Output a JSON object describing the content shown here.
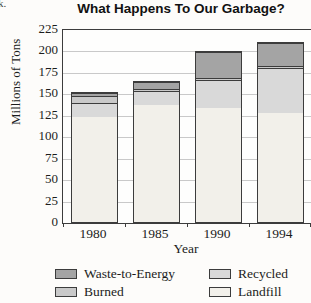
{
  "artifact": {
    "text": "k."
  },
  "chart": {
    "title": "What Happens To Our Garbage?",
    "xlabel": "Year",
    "ylabel": "Millions of Tons"
  },
  "chart_data": {
    "type": "bar",
    "subtype": "stacked",
    "title": "What Happens To Our Garbage?",
    "xlabel": "Year",
    "ylabel": "Millions of Tons",
    "categories": [
      "1980",
      "1985",
      "1990",
      "1994"
    ],
    "series": [
      {
        "name": "Landfill",
        "color": "#f2f0ea",
        "values": [
          125,
          139,
          134,
          129
        ]
      },
      {
        "name": "Recycled",
        "color": "#d9d9d9",
        "values": [
          16,
          16,
          33,
          53
        ]
      },
      {
        "name": "Burned",
        "color": "#c9c9c9",
        "values": [
          9,
          3,
          2,
          2
        ]
      },
      {
        "name": "Waste-to-Energy",
        "color": "#a4a4a4",
        "values": [
          3,
          8,
          31,
          27
        ]
      }
    ],
    "totals": [
      153,
      166,
      200,
      211
    ],
    "ylim": [
      0,
      225
    ],
    "yticks": [
      0,
      25,
      50,
      75,
      100,
      125,
      150,
      175,
      200,
      225
    ],
    "grid": true,
    "legend_position": "bottom",
    "legend_columns": [
      [
        "Waste-to-Energy",
        "Burned"
      ],
      [
        "Recycled",
        "Landfill"
      ]
    ]
  }
}
